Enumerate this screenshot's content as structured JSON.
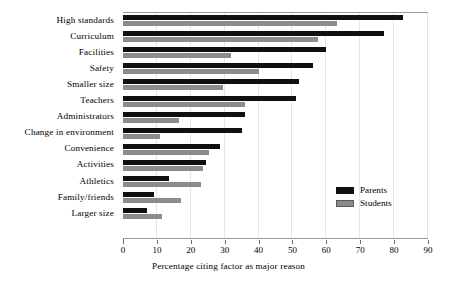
{
  "chart_data": {
    "type": "bar",
    "orientation": "horizontal",
    "title": "",
    "xlabel": "Percentage citing factor as major reason",
    "ylabel": "",
    "xlim": [
      0,
      90
    ],
    "xticks": [
      0,
      10,
      20,
      30,
      40,
      50,
      60,
      70,
      80,
      90
    ],
    "grid": false,
    "legend_position": "center-right",
    "categories": [
      "High standards",
      "Curriculum",
      "Facilities",
      "Safety",
      "Smaller size",
      "Teachers",
      "Administrators",
      "Change in  environment",
      "Convenience",
      "Activities",
      "Athletics",
      "Family/friends",
      "Larger size"
    ],
    "series": [
      {
        "name": "Parents",
        "color": "#101010",
        "values": [
          82.5,
          77,
          60,
          56,
          52,
          51,
          36,
          35,
          28.5,
          24.5,
          13.5,
          9,
          7
        ]
      },
      {
        "name": "Students",
        "color": "#8c8c8c",
        "values": [
          63,
          57.5,
          32,
          40,
          29.5,
          36,
          16.5,
          11,
          25.5,
          23.5,
          23,
          17,
          11.5
        ]
      }
    ]
  },
  "legend": {
    "items": [
      {
        "label": "Parents",
        "color": "#101010"
      },
      {
        "label": "Students",
        "color": "#8c8c8c"
      }
    ]
  }
}
